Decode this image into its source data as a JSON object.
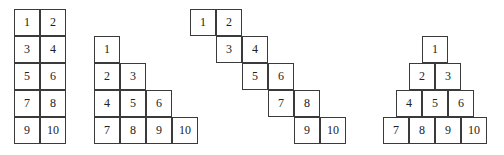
{
  "figure": {
    "cell_size": {
      "w": 26,
      "h": 27
    },
    "border_color": "#3a3a3a",
    "shapes": [
      {
        "name": "two-column-rectangle",
        "cells": [
          {
            "label": "1",
            "x": 14,
            "y": 9
          },
          {
            "label": "2",
            "x": 40,
            "y": 9
          },
          {
            "label": "3",
            "x": 14,
            "y": 36
          },
          {
            "label": "4",
            "x": 40,
            "y": 36
          },
          {
            "label": "5",
            "x": 14,
            "y": 63
          },
          {
            "label": "6",
            "x": 40,
            "y": 63
          },
          {
            "label": "7",
            "x": 14,
            "y": 90
          },
          {
            "label": "8",
            "x": 40,
            "y": 90
          },
          {
            "label": "9",
            "x": 14,
            "y": 117
          },
          {
            "label": "10",
            "x": 40,
            "y": 117
          }
        ]
      },
      {
        "name": "staircase-triangle",
        "cells": [
          {
            "label": "1",
            "x": 94,
            "y": 36
          },
          {
            "label": "2",
            "x": 94,
            "y": 63
          },
          {
            "label": "3",
            "x": 120,
            "y": 63
          },
          {
            "label": "4",
            "x": 94,
            "y": 90
          },
          {
            "label": "5",
            "x": 120,
            "y": 90
          },
          {
            "label": "6",
            "x": 146,
            "y": 90
          },
          {
            "label": "7",
            "x": 94,
            "y": 117
          },
          {
            "label": "8",
            "x": 120,
            "y": 117
          },
          {
            "label": "9",
            "x": 146,
            "y": 117
          },
          {
            "label": "10",
            "x": 172,
            "y": 117
          }
        ]
      },
      {
        "name": "diagonal-staircase",
        "cells": [
          {
            "label": "1",
            "x": 190,
            "y": 9
          },
          {
            "label": "2",
            "x": 216,
            "y": 9
          },
          {
            "label": "3",
            "x": 216,
            "y": 36
          },
          {
            "label": "4",
            "x": 242,
            "y": 36
          },
          {
            "label": "5",
            "x": 242,
            "y": 63
          },
          {
            "label": "6",
            "x": 268,
            "y": 63
          },
          {
            "label": "7",
            "x": 268,
            "y": 90
          },
          {
            "label": "8",
            "x": 294,
            "y": 90
          },
          {
            "label": "9",
            "x": 294,
            "y": 117
          },
          {
            "label": "10",
            "x": 320,
            "y": 117
          }
        ]
      },
      {
        "name": "pyramid",
        "cells": [
          {
            "label": "1",
            "x": 422,
            "y": 36
          },
          {
            "label": "2",
            "x": 409,
            "y": 63
          },
          {
            "label": "3",
            "x": 435,
            "y": 63
          },
          {
            "label": "4",
            "x": 396,
            "y": 90
          },
          {
            "label": "5",
            "x": 422,
            "y": 90
          },
          {
            "label": "6",
            "x": 448,
            "y": 90
          },
          {
            "label": "7",
            "x": 383,
            "y": 117
          },
          {
            "label": "8",
            "x": 409,
            "y": 117
          },
          {
            "label": "9",
            "x": 435,
            "y": 117
          },
          {
            "label": "10",
            "x": 461,
            "y": 117
          }
        ]
      }
    ]
  }
}
